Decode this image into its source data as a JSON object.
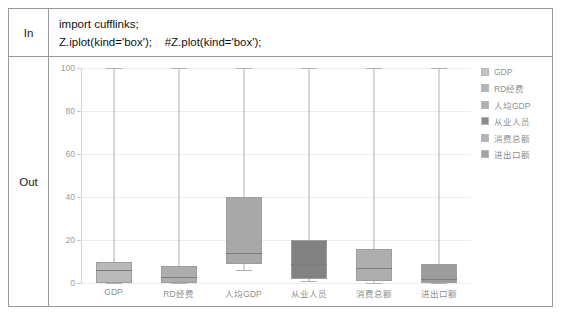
{
  "notebook": {
    "in_label": "In",
    "out_label": "Out",
    "code_lines": [
      "import cufflinks;",
      "Z.iplot(kind='box');    #Z.plot(kind='box');"
    ]
  },
  "chart_data": {
    "type": "box",
    "title": "",
    "xlabel": "",
    "ylabel": "",
    "ylim": [
      0,
      100
    ],
    "yticks": [
      0,
      20,
      40,
      60,
      80,
      100
    ],
    "grid": true,
    "legend_position": "right",
    "categories": [
      "GDP",
      "RD经费",
      "人均GDP",
      "从业人员",
      "消费总额",
      "进出口额"
    ],
    "boxes": [
      {
        "name": "GDP",
        "min": 0,
        "q1": 0,
        "median": 6,
        "q3": 10,
        "max": 100,
        "color": "#b9b9b9"
      },
      {
        "name": "RD经费",
        "min": 0,
        "q1": 0,
        "median": 3,
        "q3": 8,
        "max": 100,
        "color": "#adadad"
      },
      {
        "name": "人均GDP",
        "min": 6,
        "q1": 9,
        "median": 14,
        "q3": 40,
        "max": 100,
        "color": "#a8a8a8"
      },
      {
        "name": "从业人员",
        "min": 1,
        "q1": 2,
        "median": 9,
        "q3": 20,
        "max": 100,
        "color": "#828282"
      },
      {
        "name": "消费总额",
        "min": 0,
        "q1": 1,
        "median": 7,
        "q3": 16,
        "max": 100,
        "color": "#aeaeae"
      },
      {
        "name": "进出口额",
        "min": 0,
        "q1": 0,
        "median": 2,
        "q3": 9,
        "max": 100,
        "color": "#9c9c9c"
      }
    ],
    "legend": [
      {
        "label": "GDP",
        "color": "#c2c2c2"
      },
      {
        "label": "RD经费",
        "color": "#b5b5b5"
      },
      {
        "label": "人均GDP",
        "color": "#b0b0b0"
      },
      {
        "label": "从业人员",
        "color": "#8a8a8a"
      },
      {
        "label": "消费总额",
        "color": "#b3b3b3"
      },
      {
        "label": "进出口额",
        "color": "#a3a3a3"
      }
    ]
  }
}
